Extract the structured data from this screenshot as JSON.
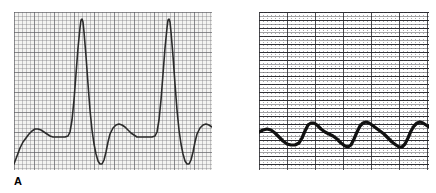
{
  "figure": {
    "background_color": "#ffffff",
    "panels": [
      {
        "id": "A",
        "label": "A",
        "description": "ECG rhythm strip, standard calibration, tall narrow QRS complexes",
        "grid": {
          "style": "light-pink-graph",
          "background_color": "#f3f3f1",
          "minor_line_color": "#787a7d",
          "major_line_color": "#5a5a5f",
          "minor_spacing_px": 4,
          "major_spacing_px": 20,
          "x": 14,
          "y": 12,
          "width": 198,
          "height": 158
        },
        "trace": {
          "color": "#2b2b2b",
          "line_width": 1.6,
          "baseline_y": 137,
          "p_wave_peak_y": 128,
          "r_wave_peak_y": 19,
          "s_wave_trough_y": 164,
          "cycle_period_px": 66,
          "cycles": 3
        }
      },
      {
        "id": "B",
        "label": "B",
        "description": "Compressed-scale strip, thick low-amplitude undulating baseline wave",
        "grid": {
          "style": "dense-horizontal-dark",
          "background_color": "#ffffff",
          "horizontal_line_color": "#1a1a1e",
          "vertical_dot_color": "#46464b",
          "major_vertical_spacing_px": 28,
          "horizontal_spacing_px": 4,
          "x": 259,
          "y": 12,
          "width": 170,
          "height": 158
        },
        "trace": {
          "color": "#111111",
          "line_width": 3.2,
          "baseline_y": 134,
          "peak_y": 124,
          "trough_y": 145,
          "cycle_period_px": 42,
          "cycles": 4
        }
      }
    ]
  },
  "chart_data": [
    {
      "type": "line",
      "title": "A",
      "xlabel": "",
      "ylabel": "",
      "grid": true,
      "legend": "none",
      "xlim": [
        0,
        198
      ],
      "ylim": [
        158,
        0
      ],
      "series": [
        {
          "name": "ecg-lead-normal-amplitude",
          "comment": "Panel A: baseline 125, P-wave bump, sharp R spike, deep S, three cycles. Coordinates are local to the 198x158 grid box.",
          "points": [
            [
              0,
              152
            ],
            [
              3,
              144
            ],
            [
              6,
              136
            ],
            [
              9,
              130
            ],
            [
              12,
              126
            ],
            [
              15,
              122
            ],
            [
              18,
              119
            ],
            [
              21,
              117
            ],
            [
              24,
              117
            ],
            [
              27,
              118
            ],
            [
              30,
              120
            ],
            [
              33,
              122
            ],
            [
              36,
              124
            ],
            [
              39,
              125
            ],
            [
              42,
              125
            ],
            [
              45,
              125
            ],
            [
              48,
              125
            ],
            [
              51,
              125
            ],
            [
              54,
              124
            ],
            [
              56,
              120
            ],
            [
              58,
              108
            ],
            [
              60,
              88
            ],
            [
              62,
              62
            ],
            [
              64,
              36
            ],
            [
              66,
              16
            ],
            [
              67,
              8
            ],
            [
              68,
              7
            ],
            [
              69,
              10
            ],
            [
              70,
              20
            ],
            [
              72,
              44
            ],
            [
              74,
              72
            ],
            [
              76,
              98
            ],
            [
              78,
              118
            ],
            [
              80,
              132
            ],
            [
              82,
              142
            ],
            [
              84,
              149
            ],
            [
              86,
              152
            ],
            [
              88,
              152
            ],
            [
              90,
              148
            ],
            [
              92,
              140
            ],
            [
              94,
              130
            ],
            [
              96,
              122
            ],
            [
              99,
              116
            ],
            [
              102,
              113
            ],
            [
              105,
              112
            ],
            [
              108,
              113
            ],
            [
              111,
              115
            ],
            [
              114,
              118
            ],
            [
              117,
              121
            ],
            [
              120,
              123
            ],
            [
              123,
              125
            ],
            [
              126,
              125
            ],
            [
              129,
              125
            ],
            [
              132,
              125
            ],
            [
              135,
              125
            ],
            [
              138,
              125
            ],
            [
              141,
              124
            ],
            [
              143,
              120
            ],
            [
              145,
              108
            ],
            [
              147,
              88
            ],
            [
              149,
              62
            ],
            [
              151,
              36
            ],
            [
              153,
              16
            ],
            [
              154,
              8
            ],
            [
              155,
              7
            ],
            [
              156,
              10
            ],
            [
              157,
              20
            ],
            [
              159,
              44
            ],
            [
              161,
              72
            ],
            [
              163,
              98
            ],
            [
              165,
              118
            ],
            [
              167,
              132
            ],
            [
              169,
              142
            ],
            [
              171,
              149
            ],
            [
              173,
              152
            ],
            [
              175,
              152
            ],
            [
              177,
              148
            ],
            [
              179,
              140
            ],
            [
              181,
              130
            ],
            [
              183,
              122
            ],
            [
              186,
              116
            ],
            [
              189,
              113
            ],
            [
              192,
              112
            ],
            [
              195,
              113
            ],
            [
              198,
              115
            ]
          ]
        }
      ]
    },
    {
      "type": "line",
      "title": "B",
      "xlabel": "",
      "ylabel": "",
      "grid": true,
      "legend": "none",
      "xlim": [
        0,
        170
      ],
      "ylim": [
        158,
        0
      ],
      "series": [
        {
          "name": "ecg-lead-low-amplitude-undulating",
          "comment": "Panel B: thick dark wave, baseline ~122, gentle peaks ~112, troughs ~133. Coordinates are local to the 170x158 grid box.",
          "points": [
            [
              0,
              120
            ],
            [
              4,
              118
            ],
            [
              8,
              117
            ],
            [
              12,
              118
            ],
            [
              16,
              121
            ],
            [
              20,
              125
            ],
            [
              24,
              129
            ],
            [
              28,
              132
            ],
            [
              32,
              133
            ],
            [
              36,
              133
            ],
            [
              40,
              131
            ],
            [
              43,
              126
            ],
            [
              46,
              119
            ],
            [
              49,
              113
            ],
            [
              52,
              111
            ],
            [
              55,
              111
            ],
            [
              58,
              113
            ],
            [
              62,
              117
            ],
            [
              66,
              120
            ],
            [
              70,
              122
            ],
            [
              74,
              124
            ],
            [
              78,
              127
            ],
            [
              82,
              131
            ],
            [
              86,
              134
            ],
            [
              89,
              135
            ],
            [
              92,
              133
            ],
            [
              95,
              127
            ],
            [
              98,
              120
            ],
            [
              101,
              114
            ],
            [
              104,
              111
            ],
            [
              107,
              110
            ],
            [
              110,
              111
            ],
            [
              113,
              113
            ],
            [
              117,
              116
            ],
            [
              121,
              119
            ],
            [
              125,
              122
            ],
            [
              129,
              126
            ],
            [
              133,
              130
            ],
            [
              137,
              133
            ],
            [
              140,
              135
            ],
            [
              143,
              135
            ],
            [
              146,
              132
            ],
            [
              149,
              126
            ],
            [
              152,
              119
            ],
            [
              155,
              114
            ],
            [
              158,
              111
            ],
            [
              161,
              110
            ],
            [
              164,
              111
            ],
            [
              167,
              113
            ],
            [
              170,
              115
            ]
          ]
        }
      ]
    }
  ]
}
